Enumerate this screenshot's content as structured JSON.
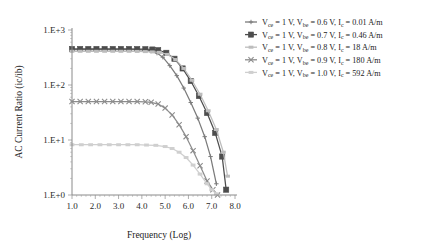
{
  "chart_data": {
    "type": "line",
    "title": "",
    "xlabel": "Frequency (Log)",
    "ylabel": "AC Current Ratio (ic/ib)",
    "xlim": [
      1.0,
      8.0
    ],
    "ylim": [
      1,
      1000
    ],
    "yscale": "log",
    "xscale": "linear",
    "grid": false,
    "legend_position": "top-right-outside",
    "xticks": [
      "1.0",
      "2.0",
      "3.0",
      "4.0",
      "5.0",
      "6.0",
      "7.0",
      "8.0"
    ],
    "xtick_values": [
      1.0,
      2.0,
      3.0,
      4.0,
      5.0,
      6.0,
      7.0,
      8.0
    ],
    "yticks": [
      "1.E+0",
      "1.E+1",
      "1.E+2",
      "1.E+3"
    ],
    "ytick_values": [
      1,
      10,
      100,
      1000
    ],
    "series": [
      {
        "name": "Vce = 1 V, Vbe = 0.6 V, Ic = 0.01 A/m",
        "legend_prefix": "V",
        "color": "#7b7b7b",
        "marker": "plus-small",
        "x": [
          1.0,
          1.35,
          1.7,
          2.05,
          2.4,
          2.75,
          3.1,
          3.45,
          3.8,
          4.15,
          4.4,
          4.65,
          4.9,
          5.2,
          5.5,
          5.8,
          6.1,
          6.4,
          6.7,
          6.95,
          7.2
        ],
        "values": [
          440,
          440,
          440,
          440,
          440,
          440,
          440,
          440,
          438,
          430,
          415,
          380,
          320,
          225,
          148,
          88,
          48,
          25,
          11.5,
          5.0,
          1.6
        ]
      },
      {
        "name": "Vce = 1 V, Vbe = 0.7 V, Ic = 0.46 A/m",
        "color": "#4d4d4d",
        "marker": "square",
        "x": [
          1.0,
          1.35,
          1.7,
          2.05,
          2.4,
          2.75,
          3.1,
          3.45,
          3.8,
          4.15,
          4.45,
          4.7,
          5.05,
          5.4,
          5.75,
          6.1,
          6.45,
          6.8,
          7.15,
          7.45,
          7.62
        ],
        "values": [
          452,
          452,
          452,
          452,
          452,
          452,
          452,
          452,
          450,
          448,
          442,
          430,
          385,
          300,
          200,
          118,
          63,
          31,
          13.5,
          5.0,
          1.25
        ]
      },
      {
        "name": "Vce = 1 V, Vbe = 0.8 V, Ic = 18 A/m",
        "color": "#bdbdbd",
        "marker": "dash",
        "x": [
          1.0,
          1.35,
          1.7,
          2.05,
          2.4,
          2.75,
          3.1,
          3.45,
          3.8,
          4.15,
          4.45,
          4.75,
          5.1,
          5.45,
          5.8,
          6.15,
          6.5,
          6.85,
          7.2,
          7.5,
          7.68
        ],
        "values": [
          410,
          410,
          410,
          410,
          410,
          410,
          410,
          410,
          408,
          405,
          400,
          392,
          360,
          290,
          200,
          122,
          68,
          34,
          15.5,
          6.0,
          2.2
        ]
      },
      {
        "name": "Vce = 1 V, Vbe = 0.9 V, Ic = 180 A/m",
        "color": "#8c8c8c",
        "marker": "x",
        "x": [
          1.0,
          1.35,
          1.7,
          2.05,
          2.4,
          2.75,
          3.1,
          3.45,
          3.8,
          4.15,
          4.4,
          4.7,
          5.0,
          5.3,
          5.6,
          5.9,
          6.2,
          6.5,
          6.8,
          7.05,
          7.25
        ],
        "values": [
          50,
          50,
          50,
          50,
          50,
          50,
          50,
          50,
          50,
          49.5,
          48.5,
          45,
          38,
          28.5,
          19,
          11.5,
          6.4,
          3.4,
          1.8,
          1.25,
          1.0
        ]
      },
      {
        "name": "Vce = 1 V, Vbe = 1.0 V, Ic = 592 A/m",
        "color": "#cfcfcf",
        "marker": "dash",
        "x": [
          1.0,
          1.4,
          1.8,
          2.2,
          2.6,
          3.0,
          3.4,
          3.8,
          4.2,
          4.6,
          5.0,
          5.3,
          5.6,
          5.9,
          6.2,
          6.5,
          6.8,
          7.0,
          7.2
        ],
        "values": [
          8.2,
          8.2,
          8.2,
          8.2,
          8.2,
          8.2,
          8.2,
          8.2,
          8.1,
          8.0,
          7.6,
          7.0,
          6.0,
          4.8,
          3.5,
          2.4,
          1.6,
          1.25,
          1.05
        ]
      }
    ]
  },
  "legend": {
    "entries": [
      {
        "marker": "plus-small",
        "color": "#7b7b7b",
        "parts": [
          "V",
          "ce",
          " = 1 V, V",
          "be",
          " = 0.6 V, I",
          "c",
          " = 0.01 A/m"
        ],
        "text": "Vce = 1 V, Vbe = 0.6 V, Ic = 0.01 A/m"
      },
      {
        "marker": "square",
        "color": "#4d4d4d",
        "parts": [
          "V",
          "ce",
          " = 1 V, V",
          "be",
          " = 0.7 V, I",
          "c",
          " = 0.46 A/m"
        ],
        "text": "Vce = 1 V, Vbe = 0.7 V, Ic = 0.46 A/m"
      },
      {
        "marker": "dash",
        "color": "#bdbdbd",
        "parts": [
          "V",
          "ce",
          " = 1 V, V",
          "be",
          " = 0.8 V, I",
          "c",
          " = 18 A/m"
        ],
        "text": "Vce = 1 V, Vbe = 0.8 V, Ic = 18 A/m"
      },
      {
        "marker": "x",
        "color": "#8c8c8c",
        "parts": [
          "V",
          "ce",
          " = 1 V, V",
          "be",
          " = 0.9 V, I",
          "c",
          " = 180 A/m"
        ],
        "text": "Vce = 1 V, Vbe = 0.9 V, Ic = 180 A/m"
      },
      {
        "marker": "dash",
        "color": "#cfcfcf",
        "parts": [
          "V",
          "ce",
          " = 1 V, V",
          "be",
          " = 1.0 V, I",
          "c",
          " = 592 A/m"
        ],
        "text": "Vce = 1 V, Vbe = 1.0 V, Ic = 592 A/m"
      }
    ]
  },
  "axes": {
    "x_title": "Frequency (Log)",
    "y_title_parts": [
      "AC Current Ratio (ic/ib)"
    ],
    "y_title": "AC Current Ratio (ic/ib)"
  }
}
